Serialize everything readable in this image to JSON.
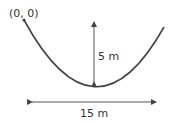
{
  "diagram": {
    "origin_label": "(0, 0)",
    "height_label": "5 m",
    "width_label": "15 m",
    "colors": {
      "curve": "#444444",
      "arrow": "#555555",
      "text": "#333333"
    }
  }
}
